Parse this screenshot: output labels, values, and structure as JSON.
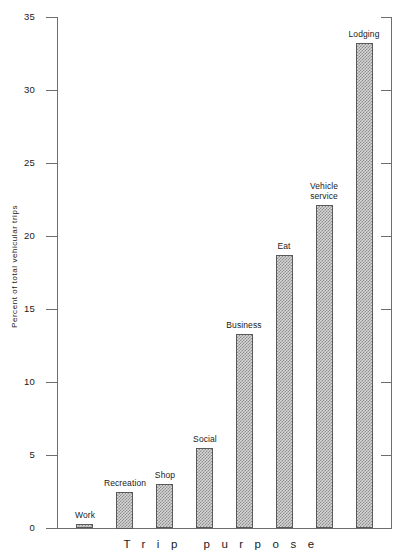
{
  "chart_data": {
    "type": "bar",
    "title": "",
    "xlabel": "Trip purpose",
    "ylabel": "Percent of total vehicular trips",
    "ylim": [
      0,
      35
    ],
    "yticks": [
      0,
      5,
      10,
      15,
      20,
      25,
      30,
      35
    ],
    "ytick_labels": [
      "0",
      "5",
      "10",
      "15",
      "20",
      "25",
      "30",
      "35"
    ],
    "grid": false,
    "legend": null,
    "categories": [
      "Work",
      "Recreation",
      "Shop",
      "Social",
      "Business",
      "Eat",
      "Vehicle service",
      "Lodging"
    ],
    "values": [
      0.3,
      2.5,
      3.0,
      5.5,
      13.3,
      18.7,
      22.1,
      33.2
    ],
    "bar_labels": [
      "Work",
      "Recreation",
      "Shop",
      "Social",
      "Business",
      "Eat",
      "Vehicle\nservice",
      "Lodging"
    ],
    "bar_fill": "#d6d6d6",
    "bar_hatch_color": "#8d8d8d",
    "bar_edge_color": "#5a5a5a",
    "axis_color": "#6e6e6e"
  },
  "axes": {
    "y_title": "Percent of total vehicular trips",
    "x_title": "Trip purpose",
    "y_ticks": [
      {
        "label": "35",
        "value": 35
      },
      {
        "label": "30",
        "value": 30
      },
      {
        "label": "25",
        "value": 25
      },
      {
        "label": "20",
        "value": 20
      },
      {
        "label": "15",
        "value": 15
      },
      {
        "label": "10",
        "value": 10
      },
      {
        "label": "5",
        "value": 5
      },
      {
        "label": "0",
        "value": 0
      }
    ]
  },
  "bars": [
    {
      "label": "Work",
      "value": 0.3
    },
    {
      "label": "Recreation",
      "value": 2.5
    },
    {
      "label": "Shop",
      "value": 3.0
    },
    {
      "label": "Social",
      "value": 5.5
    },
    {
      "label": "Business",
      "value": 13.3
    },
    {
      "label": "Eat",
      "value": 18.7
    },
    {
      "label": "Vehicle service",
      "value": 22.1
    },
    {
      "label": "Lodging",
      "value": 33.2
    }
  ]
}
